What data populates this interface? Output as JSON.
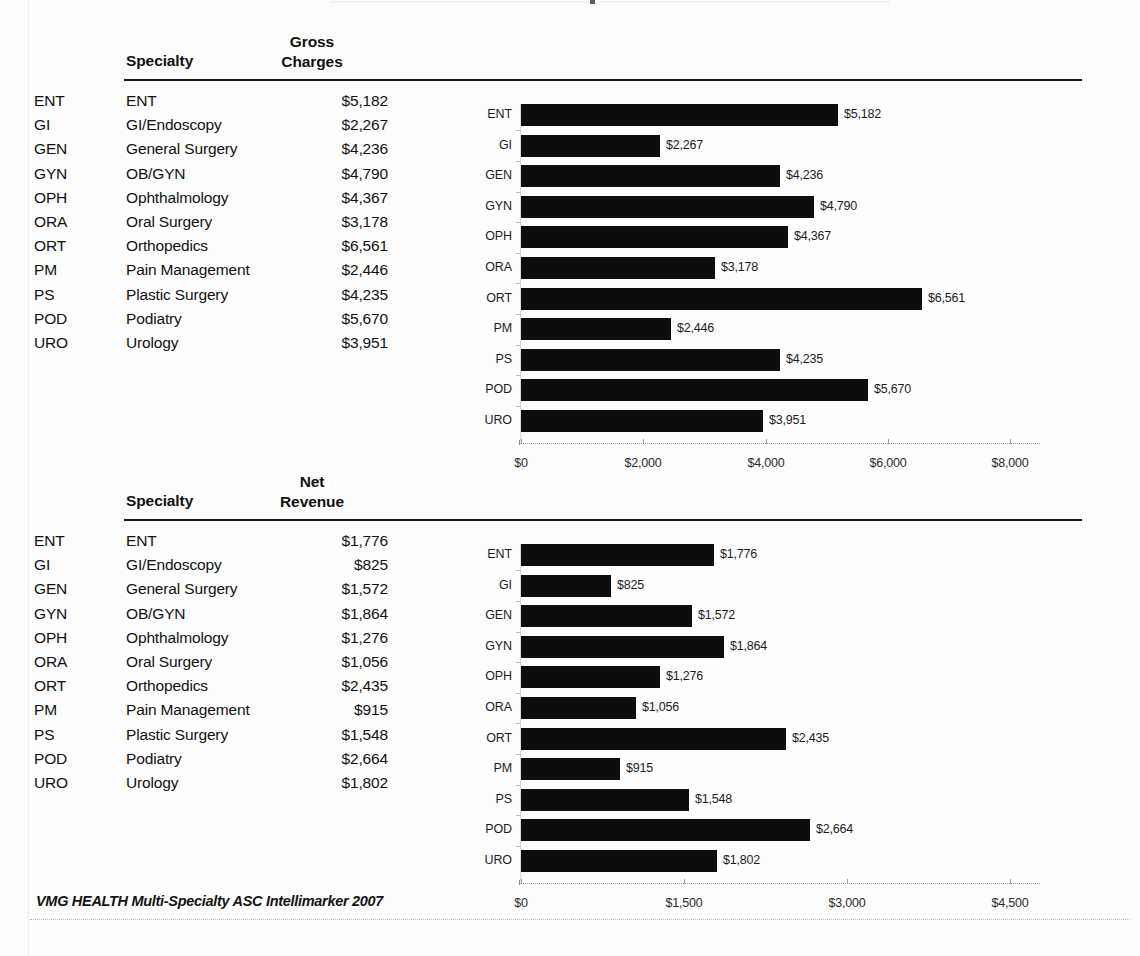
{
  "document": {
    "footer_note": "VMG HEALTH Multi-Specialty ASC Intellimarker 2007"
  },
  "blocks": [
    {
      "id": "gross",
      "table": {
        "col_specialty": "Specialty",
        "col_metric_line1": "Gross",
        "col_metric_line2": "Charges",
        "rows": [
          {
            "code": "ENT",
            "name": "ENT",
            "value": "$5,182"
          },
          {
            "code": "GI",
            "name": "GI/Endoscopy",
            "value": "$2,267"
          },
          {
            "code": "GEN",
            "name": "General Surgery",
            "value": "$4,236"
          },
          {
            "code": "GYN",
            "name": "OB/GYN",
            "value": "$4,790"
          },
          {
            "code": "OPH",
            "name": "Ophthalmology",
            "value": "$4,367"
          },
          {
            "code": "ORA",
            "name": "Oral Surgery",
            "value": "$3,178"
          },
          {
            "code": "ORT",
            "name": "Orthopedics",
            "value": "$6,561"
          },
          {
            "code": "PM",
            "name": "Pain Management",
            "value": "$2,446"
          },
          {
            "code": "PS",
            "name": "Plastic Surgery",
            "value": "$4,235"
          },
          {
            "code": "POD",
            "name": "Podiatry",
            "value": "$5,670"
          },
          {
            "code": "URO",
            "name": "Urology",
            "value": "$3,951"
          }
        ]
      }
    },
    {
      "id": "net",
      "table": {
        "col_specialty": "Specialty",
        "col_metric_line1": "Net",
        "col_metric_line2": "Revenue",
        "rows": [
          {
            "code": "ENT",
            "name": "ENT",
            "value": "$1,776"
          },
          {
            "code": "GI",
            "name": "GI/Endoscopy",
            "value": "$825"
          },
          {
            "code": "GEN",
            "name": "General Surgery",
            "value": "$1,572"
          },
          {
            "code": "GYN",
            "name": "OB/GYN",
            "value": "$1,864"
          },
          {
            "code": "OPH",
            "name": "Ophthalmology",
            "value": "$1,276"
          },
          {
            "code": "ORA",
            "name": "Oral Surgery",
            "value": "$1,056"
          },
          {
            "code": "ORT",
            "name": "Orthopedics",
            "value": "$2,435"
          },
          {
            "code": "PM",
            "name": "Pain Management",
            "value": "$915"
          },
          {
            "code": "PS",
            "name": "Plastic Surgery",
            "value": "$1,548"
          },
          {
            "code": "POD",
            "name": "Podiatry",
            "value": "$2,664"
          },
          {
            "code": "URO",
            "name": "Urology",
            "value": "$1,802"
          }
        ]
      }
    }
  ],
  "chart_data": [
    {
      "id": "gross-charges-chart",
      "type": "bar",
      "orientation": "horizontal",
      "title": "",
      "xlabel": "",
      "ylabel": "",
      "grid": false,
      "legend": "none",
      "bar_color": "#0d0d0d",
      "categories": [
        "ENT",
        "GI",
        "GEN",
        "GYN",
        "OPH",
        "ORA",
        "ORT",
        "PM",
        "PS",
        "POD",
        "URO"
      ],
      "values": [
        5182,
        2267,
        4236,
        4790,
        4367,
        3178,
        6561,
        2446,
        4235,
        5670,
        3951
      ],
      "data_labels": [
        "$5,182",
        "$2,267",
        "$4,236",
        "$4,790",
        "$4,367",
        "$3,178",
        "$6,561",
        "$2,446",
        "$4,235",
        "$5,670",
        "$3,951"
      ],
      "xlim": [
        0,
        8000
      ],
      "xticks": [
        0,
        2000,
        4000,
        6000,
        8000
      ],
      "xtick_labels": [
        "$0",
        "$2,000",
        "$4,000",
        "$6,000",
        "$8,000"
      ]
    },
    {
      "id": "net-revenue-chart",
      "type": "bar",
      "orientation": "horizontal",
      "title": "",
      "xlabel": "",
      "ylabel": "",
      "grid": false,
      "legend": "none",
      "bar_color": "#0d0d0d",
      "categories": [
        "ENT",
        "GI",
        "GEN",
        "GYN",
        "OPH",
        "ORA",
        "ORT",
        "PM",
        "PS",
        "POD",
        "URO"
      ],
      "values": [
        1776,
        825,
        1572,
        1864,
        1276,
        1056,
        2435,
        915,
        1548,
        2664,
        1802
      ],
      "data_labels": [
        "$1,776",
        "$825",
        "$1,572",
        "$1,864",
        "$1,276",
        "$1,056",
        "$2,435",
        "$915",
        "$1,548",
        "$2,664",
        "$1,802"
      ],
      "xlim": [
        0,
        4500
      ],
      "xticks": [
        0,
        1500,
        3000,
        4500
      ],
      "xtick_labels": [
        "$0",
        "$1,500",
        "$3,000",
        "$4,500"
      ]
    }
  ]
}
